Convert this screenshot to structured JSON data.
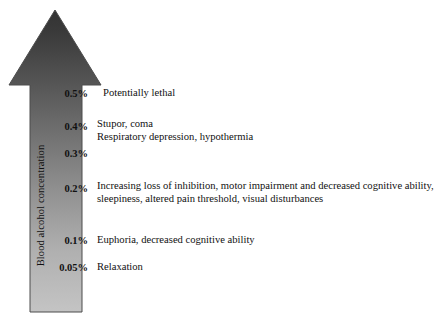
{
  "figure": {
    "axis_label": "Blood alcohol concentration",
    "arrow": {
      "direction": "up",
      "gradient_top_color": "#3a3a3a",
      "gradient_bottom_color": "#c2c2c2",
      "outline_color": "#4a4a4a"
    },
    "levels": [
      {
        "tick": "0.5%",
        "tick_top": 88,
        "text_top": 87,
        "text_left": 103,
        "lines": [
          "Potentially lethal"
        ]
      },
      {
        "tick": "0.4%",
        "tick_top": 121,
        "text_top": 118,
        "text_left": 97,
        "lines": [
          "Stupor, coma",
          "Respiratory depression, hypothermia"
        ]
      },
      {
        "tick": "0.3%",
        "tick_top": 148,
        "text_top": 148,
        "text_left": 97,
        "lines": []
      },
      {
        "tick": "0.2%",
        "tick_top": 183,
        "text_top": 180,
        "text_left": 97,
        "lines": [
          "Increasing loss of inhibition, motor impairment and decreased cognitive ability,",
          "sleepiness, altered pain threshold, visual disturbances"
        ]
      },
      {
        "tick": "0.1%",
        "tick_top": 235,
        "text_top": 234,
        "text_left": 97,
        "lines": [
          "Euphoria, decreased cognitive ability"
        ]
      },
      {
        "tick": "0.05%",
        "tick_top": 262,
        "text_top": 261,
        "text_left": 97,
        "lines": [
          "Relaxation"
        ]
      }
    ]
  },
  "chart_data": {
    "type": "bar",
    "title": "",
    "xlabel": "",
    "ylabel": "Blood alcohol concentration",
    "orientation": "vertical-arrow-scale",
    "categories": [
      "0.05%",
      "0.1%",
      "0.2%",
      "0.3%",
      "0.4%",
      "0.5%"
    ],
    "values": [
      0.05,
      0.1,
      0.2,
      0.3,
      0.4,
      0.5
    ],
    "annotations": [
      "Relaxation",
      "Euphoria, decreased cognitive ability",
      "Increasing loss of inhibition, motor impairment and decreased cognitive ability, sleepiness, altered pain threshold, visual disturbances",
      "",
      "Stupor, coma / Respiratory depression, hypothermia",
      "Potentially lethal"
    ],
    "grid": false,
    "legend": "none"
  }
}
